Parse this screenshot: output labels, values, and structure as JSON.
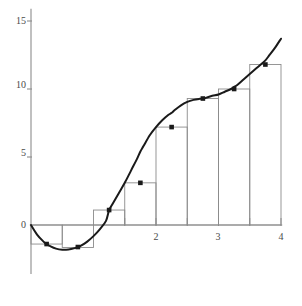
{
  "chart_data": {
    "type": "bar",
    "title": "",
    "subtitle": "",
    "xlabel": "",
    "ylabel": "",
    "xlim": [
      -0.08,
      4.1
    ],
    "ylim": [
      -3.6,
      16.0
    ],
    "grid": false,
    "legend": null,
    "annotations": [],
    "x_ticks": [
      {
        "value": 2,
        "label": "2"
      },
      {
        "value": 3,
        "label": "3"
      },
      {
        "value": 4,
        "label": "4"
      }
    ],
    "x_minor_ticks": [
      1.5,
      2,
      2.5,
      3,
      3.5,
      4
    ],
    "y_ticks": [
      {
        "value": 0,
        "label": "0"
      },
      {
        "value": 5,
        "label": "5"
      },
      {
        "value": 10,
        "label": "10"
      },
      {
        "value": 15,
        "label": "15"
      }
    ],
    "rectangles": {
      "method": "midpoint-riemann-sum",
      "count": 8,
      "width": 0.5,
      "x_start": 0,
      "x_end": 4,
      "midpoints": [
        0.25,
        0.75,
        1.25,
        1.75,
        2.25,
        2.75,
        3.25,
        3.75
      ],
      "heights": [
        -1.4,
        -1.65,
        1.1,
        3.1,
        7.2,
        9.3,
        10.0,
        11.8
      ],
      "edge_color": "#8c8c8c",
      "fill_color": "none"
    },
    "series": [
      {
        "name": "curve",
        "type": "line",
        "color": "#1a1a1a",
        "x": [
          0,
          0.1,
          0.2,
          0.25,
          0.3,
          0.4,
          0.5,
          0.6,
          0.7,
          0.75,
          0.8,
          0.9,
          1,
          1.1,
          1.2,
          1.25,
          1.3,
          1.4,
          1.5,
          1.6,
          1.7,
          1.75,
          1.8,
          1.9,
          2,
          2.1,
          2.2,
          2.25,
          2.3,
          2.4,
          2.5,
          2.6,
          2.7,
          2.75,
          2.8,
          2.9,
          3,
          3.1,
          3.2,
          3.25,
          3.3,
          3.4,
          3.5,
          3.6,
          3.7,
          3.75,
          3.8,
          3.9,
          4
        ],
        "y": [
          0,
          -0.72,
          -1.22,
          -1.4,
          -1.54,
          -1.74,
          -1.82,
          -1.8,
          -1.7,
          -1.62,
          -1.52,
          -1.22,
          -0.82,
          -0.32,
          0.3,
          1.1,
          1.5,
          2.3,
          3.1,
          4.0,
          4.9,
          5.4,
          5.8,
          6.6,
          7.2,
          7.7,
          8.1,
          8.25,
          8.45,
          8.8,
          9.05,
          9.2,
          9.28,
          9.3,
          9.35,
          9.5,
          9.6,
          9.8,
          10.0,
          10.15,
          10.3,
          10.7,
          11.1,
          11.5,
          11.9,
          12.1,
          12.4,
          13.0,
          13.7
        ]
      }
    ],
    "points": {
      "name": "midpoint-markers",
      "color": "#1a1a1a",
      "shape": "square",
      "x": [
        0.25,
        0.75,
        1.25,
        1.75,
        2.25,
        2.75,
        3.25,
        3.75
      ],
      "y": [
        -1.4,
        -1.62,
        1.1,
        3.1,
        7.2,
        9.3,
        10.0,
        11.8
      ]
    },
    "axes": {
      "axis_color": "#8c8c8c",
      "x_axis_y": 0,
      "y_axis_x": 0,
      "y_axis_top": 15.9,
      "y_axis_bottom": -3.6
    }
  }
}
